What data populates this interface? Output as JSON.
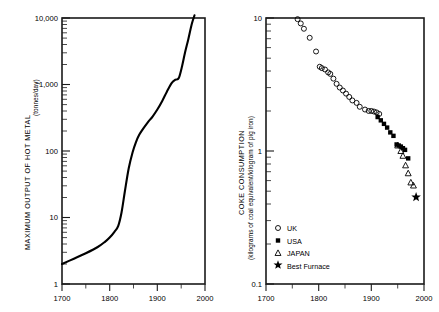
{
  "figure": {
    "background": "#ffffff",
    "ink": "#000000"
  },
  "chart_data": [
    {
      "type": "line",
      "panel": "left",
      "title": "",
      "xlabel": "",
      "ylabel": "MAXIMUM OUTPUT OF HOT METAL",
      "ylabel_units": "(tonnes/day)",
      "xlim": [
        1700,
        2000
      ],
      "ylim": [
        1,
        20000
      ],
      "yscale": "log",
      "xscale": "linear",
      "grid": false,
      "legend": "none",
      "xticks": [
        1700,
        1800,
        1900,
        2000
      ],
      "xticklabels": [
        "1700",
        "1800",
        "1900",
        "2000"
      ],
      "xminorticks": [
        1750,
        1850,
        1950
      ],
      "yticks": [
        1,
        10,
        100,
        1000,
        10000
      ],
      "yticklabels": [
        "1",
        "10",
        "100",
        "1,000",
        "10,000"
      ],
      "series": [
        {
          "name": "Maximum output of hot metal",
          "x": [
            1700,
            1725,
            1750,
            1775,
            1790,
            1800,
            1810,
            1818,
            1825,
            1832,
            1840,
            1848,
            1855,
            1862,
            1870,
            1880,
            1890,
            1900,
            1910,
            1920,
            1930,
            1938,
            1945,
            1952,
            1958,
            1965,
            1972,
            1978
          ],
          "values": [
            2.0,
            2.4,
            2.9,
            3.6,
            4.3,
            5.0,
            6.1,
            7.5,
            12.0,
            25.0,
            55.0,
            95.0,
            135.0,
            175.0,
            215.0,
            270.0,
            330.0,
            420.0,
            560.0,
            780.0,
            1050.0,
            1180.0,
            1250.0,
            1900.0,
            3000.0,
            4800.0,
            8000.0,
            11000.0
          ]
        }
      ]
    },
    {
      "type": "scatter",
      "panel": "right",
      "title": "",
      "xlabel": "",
      "ylabel": "COKE  CONSUMPTION",
      "ylabel_units": "(kilograms of coal equivalent/kilogram of pig iron)",
      "xlim": [
        1700,
        2000
      ],
      "ylim": [
        0.1,
        10
      ],
      "yscale": "log",
      "xscale": "linear",
      "grid": false,
      "legend": "lower-left",
      "xticks": [
        1700,
        1800,
        1900,
        2000
      ],
      "xticklabels": [
        "1700",
        "1800",
        "1900",
        "2000"
      ],
      "xminorticks": [
        1750,
        1850,
        1950
      ],
      "yticks": [
        0.1,
        1,
        10
      ],
      "yticklabels": [
        "0.1",
        "1",
        "10"
      ],
      "series": [
        {
          "name": "UK",
          "marker": "open-circle",
          "x": [
            1760,
            1766,
            1772,
            1783,
            1795,
            1802,
            1806,
            1812,
            1818,
            1822,
            1828,
            1834,
            1840,
            1846,
            1852,
            1858,
            1864,
            1872,
            1878,
            1888,
            1895,
            1900,
            1905,
            1910,
            1915
          ],
          "values": [
            9.8,
            9.1,
            8.3,
            7.1,
            5.6,
            4.3,
            4.2,
            4.1,
            3.9,
            3.8,
            3.5,
            3.2,
            3.0,
            2.85,
            2.7,
            2.55,
            2.4,
            2.3,
            2.15,
            2.05,
            2.0,
            2.0,
            1.98,
            1.95,
            1.9
          ]
        },
        {
          "name": "USA",
          "marker": "filled-square",
          "x": [
            1912,
            1918,
            1924,
            1930,
            1936,
            1942,
            1948,
            1952,
            1956,
            1960,
            1964,
            1970
          ],
          "values": [
            1.8,
            1.7,
            1.6,
            1.5,
            1.38,
            1.3,
            1.12,
            1.1,
            1.08,
            1.05,
            1.02,
            0.88
          ]
        },
        {
          "name": "JAPAN",
          "marker": "open-triangle",
          "x": [
            1950,
            1956,
            1960,
            1965,
            1970,
            1975,
            1980
          ],
          "values": [
            1.1,
            1.0,
            0.92,
            0.78,
            0.68,
            0.58,
            0.55
          ]
        },
        {
          "name": "Best Furnace",
          "marker": "star",
          "x": [
            1985
          ],
          "values": [
            0.45
          ]
        }
      ],
      "legend_entries": [
        {
          "label": "UK",
          "marker": "open-circle"
        },
        {
          "label": "USA",
          "marker": "filled-square"
        },
        {
          "label": "JAPAN",
          "marker": "open-triangle"
        },
        {
          "label": "Best Furnace",
          "marker": "star"
        }
      ]
    }
  ],
  "left_panel": {
    "ylabel": "MAXIMUM OUTPUT OF HOT METAL",
    "ylabel_units": "(tonnes/day)",
    "yticklabels": {
      "t10000": "10,000",
      "t1000": "1,000",
      "t100": "100",
      "t10": "10",
      "t1": "1"
    },
    "xticklabels": {
      "x1700": "1700",
      "x1800": "1800",
      "x1900": "1900",
      "x2000": "2000"
    }
  },
  "right_panel": {
    "ylabel": "COKE  CONSUMPTION",
    "ylabel_units": "(kilograms of coal equivalent/kilogram of pig iron)",
    "yticklabels": {
      "t10": "10",
      "t1": "1",
      "t01": "0.1"
    },
    "xticklabels": {
      "x1700": "1700",
      "x1800": "1800",
      "x1900": "1900",
      "x2000": "2000"
    },
    "legend": {
      "uk": "UK",
      "usa": "USA",
      "japan": "JAPAN",
      "best": "Best Furnace"
    }
  }
}
